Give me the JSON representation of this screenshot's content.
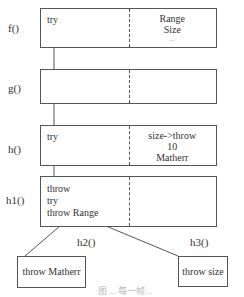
{
  "frames": [
    {
      "label": "f()",
      "left": [
        "try"
      ],
      "right": [
        "Range",
        "Size",
        "..."
      ]
    },
    {
      "label": "g()",
      "left": [],
      "right": []
    },
    {
      "label": "h()",
      "left": [
        "try"
      ],
      "right": [
        "size->throw",
        "10",
        "Matherr"
      ]
    },
    {
      "label": "h1()",
      "left": [
        "throw",
        "try",
        "throw Range"
      ],
      "right": []
    }
  ],
  "children": [
    {
      "label": "h2()",
      "text": "throw Matherr"
    },
    {
      "label": "h3()",
      "text": "throw size"
    }
  ],
  "caption": "图 ... 每一帧... "
}
